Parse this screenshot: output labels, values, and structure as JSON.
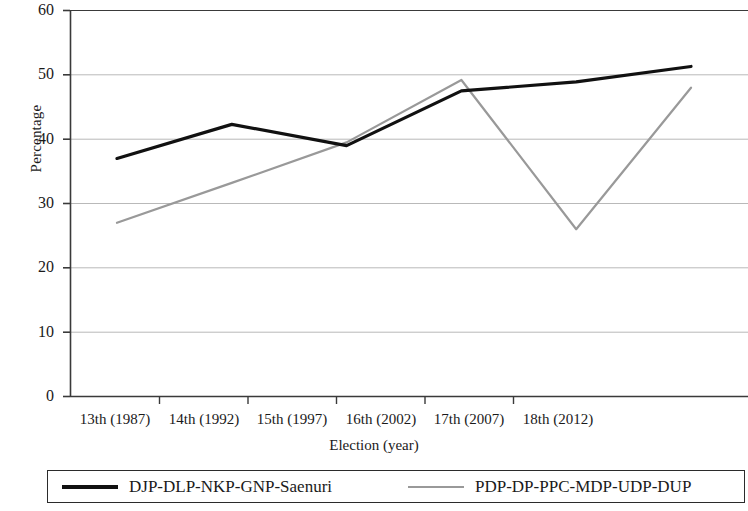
{
  "chart_data": {
    "type": "line",
    "title": "",
    "xlabel": "Election (year)",
    "ylabel": "Percentage",
    "categories": [
      "13th (1987)",
      "14th (1992)",
      "15th (1997)",
      "16th (2002)",
      "17th (2007)",
      "18th (2012)"
    ],
    "series": [
      {
        "name": "DJP-DLP-NKP-GNP-Saenuri",
        "color": "#111111",
        "values": [
          37,
          42.3,
          39,
          47.5,
          48.9,
          51.3
        ]
      },
      {
        "name": "PDP-DP-PPC-MDP-UDP-DUP",
        "color": "#999999",
        "values": [
          27,
          33.2,
          39.5,
          49.2,
          26,
          48
        ]
      }
    ],
    "ylim": [
      0,
      60
    ],
    "ytick_values": [
      "0",
      "10",
      "20",
      "30",
      "40",
      "50",
      "60"
    ],
    "grid": "horizontal",
    "legend_position": "bottom"
  },
  "axes": {
    "y_title": "Percentage",
    "x_title": "Election (year)",
    "y_ticks": [
      "60",
      "50",
      "40",
      "30",
      "20",
      "10",
      "0"
    ],
    "x_ticks": [
      "13th (1987)",
      "14th (1992)",
      "15th (1997)",
      "16th (2002)",
      "17th (2007)",
      "18th (2012)"
    ]
  },
  "legend": {
    "entries": [
      {
        "label": "DJP-DLP-NKP-GNP-Saenuri",
        "style": "thick-dark-line"
      },
      {
        "label": "PDP-DP-PPC-MDP-UDP-DUP",
        "style": "thin-gray-line"
      }
    ]
  },
  "colors": {
    "series_dark": "#111111",
    "series_light": "#999999",
    "gridline": "#b9b9b9",
    "axis": "#3a3a3a",
    "background": "#ffffff"
  }
}
